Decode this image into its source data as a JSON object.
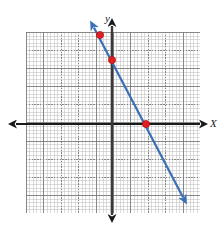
{
  "figure": {
    "type": "coordinate-plane-graph",
    "background_color": "#ffffff",
    "axis_color": "#1a1a1a",
    "grid_major_color": "#787878",
    "grid_minor_color": "#aaaaaa",
    "line_color": "#3a6fb5",
    "point_color": "#e02020",
    "point_stroke_color": "#b01010"
  },
  "axes": {
    "x_label": "X",
    "y_label": "y",
    "x_axis": {
      "y_pixel": 124,
      "x_start": 10,
      "x_end": 206,
      "arrow_left": true,
      "arrow_right": true
    },
    "y_axis": {
      "x_pixel": 112,
      "y_start": 20,
      "y_end": 221,
      "arrow_up": true,
      "arrow_down": true
    }
  },
  "grid": {
    "left": 26,
    "top": 32,
    "width": 174,
    "height": 181,
    "major_spacing_x": 17.4,
    "major_spacing_y": 18.1,
    "minor_per_major": 5,
    "style": "dotted"
  },
  "chart_data": {
    "type": "line",
    "title": "",
    "xlabel": "X",
    "ylabel": "y",
    "grid": true,
    "legend": false,
    "xlim": [
      -5,
      5
    ],
    "ylim": [
      -5,
      5
    ],
    "series": [
      {
        "name": "line",
        "kind": "arrow-line",
        "slope": -2,
        "y_intercept": 3.5,
        "pixel_start": {
          "x": 92,
          "y": 24
        },
        "pixel_end": {
          "x": 185,
          "y": 201
        },
        "arrow_start": true,
        "arrow_end": true,
        "color": "#3a6fb5",
        "width": 2.2
      }
    ],
    "points": [
      {
        "label": "point-1",
        "pixel": {
          "x": 100,
          "y": 35
        },
        "x": -0.7,
        "y": 4.9
      },
      {
        "label": "point-2",
        "pixel": {
          "x": 112,
          "y": 60
        },
        "x": 0,
        "y": 3.5
      },
      {
        "label": "point-3",
        "pixel": {
          "x": 146,
          "y": 124
        },
        "x": 2,
        "y": 0
      }
    ],
    "point_radius": 3.6
  }
}
